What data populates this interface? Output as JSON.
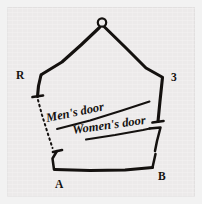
{
  "figure": {
    "background_color": "#eceaea",
    "ink_color": "#14110f",
    "border_color": "#e2e0e0"
  },
  "vertices": [
    {
      "id": "apex",
      "label": "O",
      "marker": "small-circle"
    },
    {
      "id": "upper-left",
      "label": "R",
      "marker": "corner"
    },
    {
      "id": "upper-right",
      "label": "3",
      "marker": "corner"
    },
    {
      "id": "lower-left",
      "label": "A",
      "marker": "corner"
    },
    {
      "id": "lower-right",
      "label": "B",
      "marker": "corner"
    }
  ],
  "doors": [
    {
      "id": "mens-door",
      "label": "Men's door",
      "underlined": true
    },
    {
      "id": "womens-door",
      "label": "Women's door",
      "underlined": true
    }
  ],
  "annotations": {
    "dashed_wall": "dotted line from left wall down to vertex A"
  }
}
